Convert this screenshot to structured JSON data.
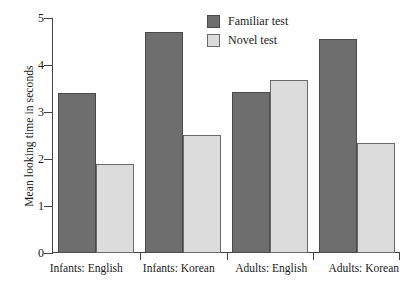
{
  "chart_data": {
    "type": "bar",
    "title": "",
    "xlabel": "",
    "ylabel": "Mean looking time in seconds",
    "ylim": [
      0,
      5
    ],
    "yticks": [
      "0",
      "1",
      "2",
      "3",
      "4",
      "5"
    ],
    "grid": false,
    "legend_position": "top-center",
    "categories": [
      "Infants: English",
      "Infants: Korean",
      "Adults: English",
      "Adults: Korean"
    ],
    "series": [
      {
        "name": "Familiar test",
        "color": "#6e6e6e",
        "values": [
          3.4,
          4.7,
          3.42,
          4.55
        ]
      },
      {
        "name": "Novel test",
        "color": "#dcdcdc",
        "values": [
          1.9,
          2.52,
          3.68,
          2.35
        ]
      }
    ]
  }
}
